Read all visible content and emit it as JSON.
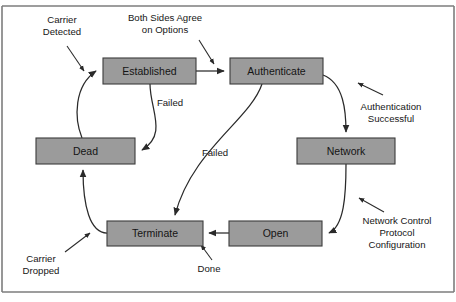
{
  "figure": {
    "kind": "state-transition-diagram",
    "background_color": "#ffffff",
    "frame_color": "#7d7d7d",
    "box_fill_color": "#9b9b9b",
    "box_stroke_color": "#3b3b3b",
    "line_color": "#2a2a2a",
    "text_color": "#141414"
  },
  "states": [
    {
      "id": "established",
      "label": "Established",
      "x": 103,
      "y": 58,
      "w": 93,
      "h": 26
    },
    {
      "id": "authenticate",
      "label": "Authenticate",
      "x": 230,
      "y": 58,
      "w": 93,
      "h": 26
    },
    {
      "id": "dead",
      "label": "Dead",
      "x": 36,
      "y": 138,
      "w": 99,
      "h": 26
    },
    {
      "id": "network",
      "label": "Network",
      "x": 297,
      "y": 138,
      "w": 98,
      "h": 26
    },
    {
      "id": "terminate",
      "label": "Terminate",
      "x": 107,
      "y": 221,
      "w": 96,
      "h": 25
    },
    {
      "id": "open",
      "label": "Open",
      "x": 229,
      "y": 221,
      "w": 93,
      "h": 25
    }
  ],
  "transitions": [
    {
      "id": "dead-to-established",
      "from": "dead",
      "to": "established",
      "label": ""
    },
    {
      "id": "established-to-authenticate",
      "from": "established",
      "to": "authenticate",
      "label": ""
    },
    {
      "id": "established-to-dead",
      "from": "established",
      "to": "dead",
      "label": "Failed"
    },
    {
      "id": "authenticate-to-terminate",
      "from": "authenticate",
      "to": "terminate",
      "label": "Failed"
    },
    {
      "id": "authenticate-to-network",
      "from": "authenticate",
      "to": "network",
      "label": ""
    },
    {
      "id": "network-to-open",
      "from": "network",
      "to": "open",
      "label": ""
    },
    {
      "id": "open-to-terminate",
      "from": "open",
      "to": "terminate",
      "label": ""
    },
    {
      "id": "terminate-to-dead",
      "from": "terminate",
      "to": "dead",
      "label": ""
    }
  ],
  "edge_labels": [
    {
      "id": "failed-established-dead",
      "text": "Failed",
      "x": 170,
      "y": 103
    },
    {
      "id": "failed-authenticate-terminate",
      "text": "Failed",
      "x": 215,
      "y": 153
    }
  ],
  "annotations": [
    {
      "id": "carrier-detected",
      "lines": [
        "Carrier",
        "Detected"
      ],
      "x": 62,
      "y": 28,
      "points_to": "dead-to-established"
    },
    {
      "id": "both-sides-agree-on-options",
      "lines": [
        "Both Sides Agree",
        "on Options"
      ],
      "x": 165,
      "y": 26,
      "points_to": "established-to-authenticate"
    },
    {
      "id": "authentication-successful",
      "lines": [
        "Authentication",
        "Successful"
      ],
      "x": 391,
      "y": 113,
      "points_to": "authenticate-to-network"
    },
    {
      "id": "network-control-protocol-configuration",
      "lines": [
        "Network Control",
        "Protocol",
        "Configuration"
      ],
      "x": 397,
      "y": 231,
      "points_to": "network-to-open"
    },
    {
      "id": "carrier-dropped",
      "lines": [
        "Carrier",
        "Dropped"
      ],
      "x": 41,
      "y": 264,
      "points_to": "terminate-to-dead"
    },
    {
      "id": "done",
      "lines": [
        "Done"
      ],
      "x": 209,
      "y": 269,
      "points_to": "open-to-terminate"
    }
  ]
}
